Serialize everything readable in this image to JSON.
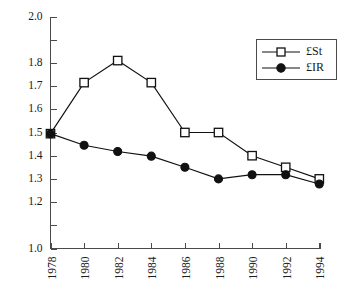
{
  "chart_data": {
    "type": "line",
    "title": "",
    "subtitle": "",
    "xlabel": "",
    "ylabel": "",
    "x": [
      1978,
      1980,
      1982,
      1984,
      1986,
      1988,
      1990,
      1992,
      1994
    ],
    "xtick_labels": [
      "1978",
      "1980",
      "1982",
      "1984",
      "1986",
      "1988",
      "1990",
      "1992",
      "1994"
    ],
    "ytick_labels": [
      "2.0",
      "1.8",
      "1.7",
      "1.6",
      "1.5",
      "1.4",
      "1.3",
      "1.2",
      "1.0"
    ],
    "ytick_values": [
      2.0,
      1.8,
      1.7,
      1.6,
      1.5,
      1.4,
      1.3,
      1.2,
      1.0
    ],
    "yticks_unlabeled": [
      1.9,
      1.1
    ],
    "ylim": [
      1.0,
      2.0
    ],
    "xlim": [
      1978,
      1994
    ],
    "grid": false,
    "legend_position": "top-right",
    "series": [
      {
        "name": "£St",
        "marker": "open-square",
        "color": "#111111",
        "values": [
          1.495,
          1.715,
          1.81,
          1.715,
          1.5,
          1.5,
          1.4,
          1.35,
          1.3
        ]
      },
      {
        "name": "£IR",
        "marker": "filled-circle",
        "color": "#111111",
        "values": [
          1.495,
          1.445,
          1.418,
          1.398,
          1.35,
          1.3,
          1.318,
          1.318,
          1.278
        ]
      }
    ]
  },
  "legend": {
    "entries": [
      {
        "label": "£St"
      },
      {
        "label": "£IR"
      }
    ]
  },
  "caption": {
    "text": ""
  }
}
